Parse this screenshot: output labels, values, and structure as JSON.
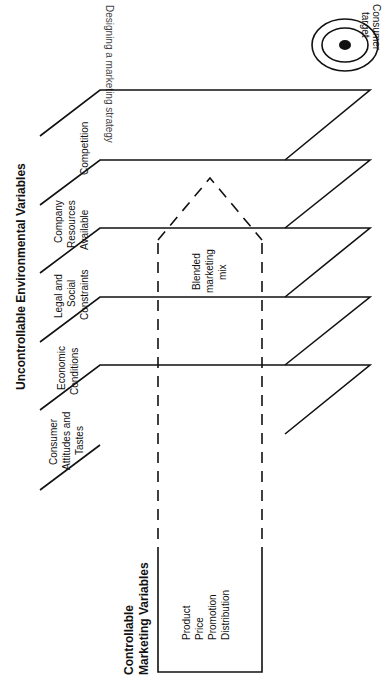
{
  "figure": {
    "title_clipped": "Designing a marketing strategy",
    "uncontrollable_heading": "Uncontrollable Environmental Variables",
    "controllable_heading": [
      "Controllable",
      "Marketing Variables"
    ],
    "planes": [
      {
        "label": [
          "Consumer",
          "Attitudes and",
          "Tastes"
        ]
      },
      {
        "label": [
          "Economic",
          "Conditions"
        ]
      },
      {
        "label": [
          "Legal and",
          "Social",
          "Constraints"
        ]
      },
      {
        "label": [
          "Company",
          "Resources",
          "Available"
        ]
      },
      {
        "label": [
          "Competition"
        ]
      }
    ],
    "marketing_mix_items": [
      "Product",
      "Price",
      "Promotion",
      "Distribution"
    ],
    "blended_label": [
      "Blended",
      "marketing",
      "mix"
    ],
    "target_label": [
      "Consumer",
      "target"
    ],
    "colors": {
      "ink": "#111111",
      "background": "#ffffff"
    }
  }
}
